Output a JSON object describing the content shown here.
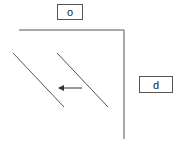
{
  "labels": {
    "top": "o",
    "right": "d"
  },
  "colors": {
    "line": "#555555",
    "background": "#ffffff"
  },
  "shapes": {
    "top_line": {
      "x1": 19,
      "y1": 30,
      "x2": 124,
      "y2": 30
    },
    "vertical_line": {
      "x1": 124,
      "y1": 30,
      "x2": 124,
      "y2": 139
    },
    "diagonal_1": {
      "x1": 13,
      "y1": 53,
      "x2": 64,
      "y2": 107
    },
    "diagonal_2": {
      "x1": 57,
      "y1": 53,
      "x2": 108,
      "y2": 107
    },
    "arrow": {
      "x1": 82,
      "y1": 88,
      "x2": 57,
      "y2": 88,
      "direction": "left"
    }
  }
}
